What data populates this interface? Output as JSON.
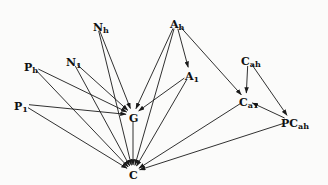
{
  "figure": {
    "type": "directed-graph",
    "background_color": "#fbfbfa",
    "edge_color": "#1a1a1a",
    "label_color": "#111111"
  },
  "nodes": [
    {
      "id": "N_h",
      "base": "N",
      "sub": "h",
      "x": 93,
      "y": 18,
      "anchor_x": 97,
      "anchor_y": 24
    },
    {
      "id": "A_h",
      "base": "A",
      "sub": "h",
      "x": 170,
      "y": 15,
      "anchor_x": 176,
      "anchor_y": 22
    },
    {
      "id": "N_1",
      "base": "N",
      "sub": "1",
      "x": 66,
      "y": 53,
      "anchor_x": 72,
      "anchor_y": 60
    },
    {
      "id": "C_ah",
      "base": "C",
      "sub": "ah",
      "x": 241,
      "y": 52,
      "anchor_x": 248,
      "anchor_y": 59
    },
    {
      "id": "P_h",
      "base": "P",
      "sub": "h",
      "x": 24,
      "y": 58,
      "anchor_x": 32,
      "anchor_y": 66
    },
    {
      "id": "A_1",
      "base": "A",
      "sub": "1",
      "x": 185,
      "y": 67,
      "anchor_x": 190,
      "anchor_y": 74
    },
    {
      "id": "P_1",
      "base": "P",
      "sub": "1",
      "x": 14,
      "y": 97,
      "anchor_x": 22,
      "anchor_y": 104
    },
    {
      "id": "C_a1",
      "base": "C",
      "sub": "a1",
      "x": 239,
      "y": 93,
      "anchor_x": 246,
      "anchor_y": 100
    },
    {
      "id": "PC_ah",
      "base": "PC",
      "sub": "ah",
      "x": 281,
      "y": 114,
      "anchor_x": 291,
      "anchor_y": 121
    },
    {
      "id": "G",
      "base": "G",
      "sub": "",
      "x": 129,
      "y": 109,
      "anchor_x": 133,
      "anchor_y": 115
    },
    {
      "id": "C",
      "base": "C",
      "sub": "",
      "x": 129,
      "y": 166,
      "anchor_x": 133,
      "anchor_y": 172
    }
  ],
  "edges": [
    {
      "from": "N_h",
      "to": "G"
    },
    {
      "from": "N_h",
      "to": "C"
    },
    {
      "from": "A_h",
      "to": "G"
    },
    {
      "from": "A_h",
      "to": "C"
    },
    {
      "from": "A_h",
      "to": "A_1"
    },
    {
      "from": "A_h",
      "to": "C_a1"
    },
    {
      "from": "N_1",
      "to": "G"
    },
    {
      "from": "N_1",
      "to": "C"
    },
    {
      "from": "P_h",
      "to": "G"
    },
    {
      "from": "P_h",
      "to": "C"
    },
    {
      "from": "A_1",
      "to": "G"
    },
    {
      "from": "A_1",
      "to": "C"
    },
    {
      "from": "P_1",
      "to": "G"
    },
    {
      "from": "P_1",
      "to": "C"
    },
    {
      "from": "C_ah",
      "to": "C_a1"
    },
    {
      "from": "C_ah",
      "to": "PC_ah"
    },
    {
      "from": "C_a1",
      "to": "C"
    },
    {
      "from": "PC_ah",
      "to": "C_a1"
    },
    {
      "from": "PC_ah",
      "to": "C"
    },
    {
      "from": "G",
      "to": "C"
    }
  ]
}
